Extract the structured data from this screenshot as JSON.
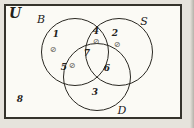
{
  "universe_label": "U",
  "mark_glyph": "⊘",
  "sets": {
    "b": "B",
    "s": "S",
    "d": "D"
  },
  "regions": {
    "r1": {
      "label": "1",
      "set": "B only",
      "marked": true
    },
    "r2": {
      "label": "2",
      "set": "S only",
      "marked": true
    },
    "r3": {
      "label": "3",
      "set": "D only",
      "marked": false
    },
    "r4": {
      "label": "4",
      "set": "B and S only",
      "marked": true
    },
    "r5": {
      "label": "5",
      "set": "B and D only",
      "marked": true
    },
    "r6": {
      "label": "6",
      "set": "S and D only",
      "marked": false
    },
    "r7": {
      "label": "7",
      "set": "B and S and D",
      "marked": false
    },
    "r8": {
      "label": "8",
      "set": "outside all sets",
      "marked": false
    }
  },
  "colors": {
    "ink": "#2a2822",
    "paper": "#fbfaf5",
    "background": "#e6e3dc"
  }
}
